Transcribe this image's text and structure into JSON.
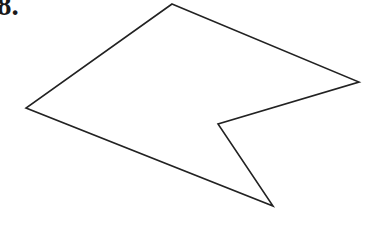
{
  "page": {
    "width": 369,
    "height": 239,
    "background_color": "#ffffff"
  },
  "problem": {
    "number_label": "8.",
    "label_color": "#1a1a1a",
    "clipped": "top-left"
  },
  "figure": {
    "name": "concave-polygon",
    "stroke_color": "#222222",
    "stroke_width": 1.6,
    "fill": "none",
    "vertex_count": 5,
    "reflex_vertex_index": 2,
    "vertices": [
      {
        "name": "top-vertex",
        "x": 172,
        "y": 4
      },
      {
        "name": "right-vertex",
        "x": 359,
        "y": 82
      },
      {
        "name": "notch-vertex",
        "x": 218,
        "y": 124
      },
      {
        "name": "bottom-vertex",
        "x": 273,
        "y": 206
      },
      {
        "name": "left-vertex",
        "x": 26,
        "y": 108
      }
    ],
    "points_attr": "172,4 359,82 218,124 273,206 26,108"
  }
}
